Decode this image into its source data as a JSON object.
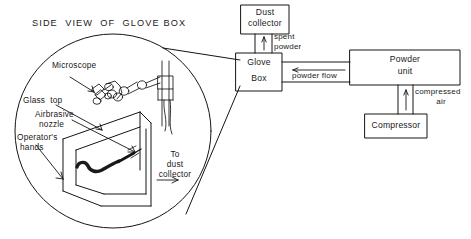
{
  "figure": {
    "title": "SIDE  VIEW  OF  GLOVE BOX",
    "kind": "schematic-diagram"
  },
  "detail_circle": {
    "labels": {
      "microscope": "Microscope",
      "glass_top": "Glass  top",
      "airbrasive_nozzle_line1": "Airbrasive",
      "airbrasive_nozzle_line2": "nozzle",
      "operators_hands_line1": "Operator's",
      "operators_hands_line2": "hands",
      "to_dust_collector_line1": "To",
      "to_dust_collector_line2": "dust",
      "to_dust_collector_line3": "collector"
    }
  },
  "flow_diagram": {
    "boxes": [
      {
        "id": "dust-collector",
        "line1": "Dust",
        "line2": "collector"
      },
      {
        "id": "glove-box",
        "line1": "Glove",
        "line2": "Box"
      },
      {
        "id": "powder-unit",
        "line1": "Powder",
        "line2": "unit"
      },
      {
        "id": "compressor",
        "line1": "Compressor",
        "line2": ""
      }
    ],
    "flow_labels": [
      {
        "id": "spent-powder",
        "line1": "spent",
        "line2": "powder"
      },
      {
        "id": "powder-flow",
        "line1": "powder flow",
        "line2": ""
      },
      {
        "id": "compressed-air",
        "line1": "compressed",
        "line2": "air"
      }
    ]
  },
  "colors": {
    "ink": "#1a1a1a",
    "line": "#141414",
    "paper": "#ffffff"
  }
}
